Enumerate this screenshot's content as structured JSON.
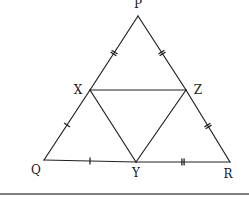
{
  "diagram": {
    "type": "geometry-triangle-midpoints",
    "points": {
      "P": {
        "label": "P",
        "x": 138,
        "y": 16,
        "lx": 138,
        "ly": 8
      },
      "X": {
        "label": "X",
        "x": 90,
        "y": 90,
        "lx": 78,
        "ly": 94
      },
      "Z": {
        "label": "Z",
        "x": 186,
        "y": 90,
        "lx": 198,
        "ly": 94
      },
      "Q": {
        "label": "Q",
        "x": 44,
        "y": 160,
        "lx": 36,
        "ly": 174
      },
      "Y": {
        "label": "Y",
        "x": 136,
        "y": 162,
        "lx": 136,
        "ly": 177
      },
      "R": {
        "label": "R",
        "x": 230,
        "y": 162,
        "lx": 228,
        "ly": 178
      }
    },
    "segments": [
      {
        "from": "P",
        "to": "X",
        "ticks": 2
      },
      {
        "from": "X",
        "to": "Q",
        "ticks": 1
      },
      {
        "from": "P",
        "to": "Z",
        "ticks": 2
      },
      {
        "from": "Z",
        "to": "R",
        "ticks": 2
      },
      {
        "from": "Q",
        "to": "Y",
        "ticks": 1
      },
      {
        "from": "Y",
        "to": "R",
        "ticks": 2
      },
      {
        "from": "X",
        "to": "Z",
        "ticks": 0
      },
      {
        "from": "X",
        "to": "Y",
        "ticks": 0
      },
      {
        "from": "Z",
        "to": "Y",
        "ticks": 0
      }
    ],
    "bottom_rule": {
      "y": 194,
      "x1": 0,
      "x2": 249
    }
  }
}
